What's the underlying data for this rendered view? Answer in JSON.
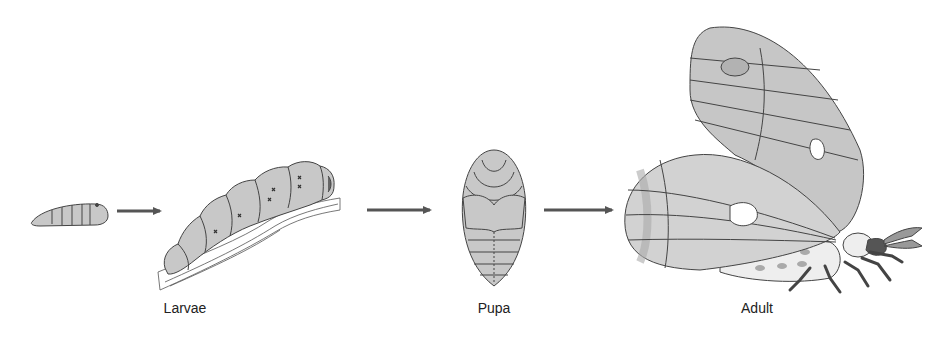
{
  "diagram": {
    "type": "life-cycle",
    "stages": [
      {
        "id": "larvae",
        "label": "Larvae"
      },
      {
        "id": "pupa",
        "label": "Pupa"
      },
      {
        "id": "adult",
        "label": "Adult"
      }
    ],
    "arrows": [
      {
        "from": "small-larva",
        "to": "large-larva"
      },
      {
        "from": "larvae",
        "to": "pupa"
      },
      {
        "from": "pupa",
        "to": "adult"
      }
    ],
    "colors": {
      "body_fill": "#c8c8c8",
      "outline": "#444444",
      "arrow": "#555555",
      "wing_band": "#b0b0b0",
      "legs": "#555555",
      "background": "#ffffff"
    }
  }
}
